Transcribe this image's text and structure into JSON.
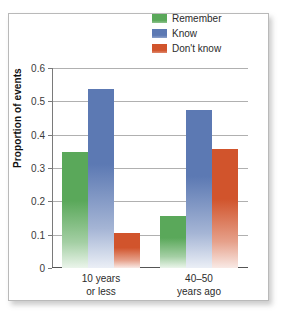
{
  "chart_data": {
    "type": "bar",
    "title": "",
    "xlabel": "",
    "ylabel": "Proportion of events",
    "ylim": [
      0,
      0.6
    ],
    "yticks": [
      "0",
      "0.1",
      "0.2",
      "0.3",
      "0.4",
      "0.5",
      "0.6"
    ],
    "ytick_values": [
      0,
      0.1,
      0.2,
      0.3,
      0.4,
      0.5,
      0.6
    ],
    "grid": true,
    "legend_position": "top-right",
    "categories": [
      "10 years\nor less",
      "40–50\nyears ago"
    ],
    "category_lines": [
      [
        "10 years",
        "or less"
      ],
      [
        "40–50",
        "years ago"
      ]
    ],
    "series": [
      {
        "name": "Remember",
        "color": "#5aa85a",
        "values": [
          0.347,
          0.156
        ]
      },
      {
        "name": "Know",
        "color": "#5c79b3",
        "values": [
          0.536,
          0.474
        ]
      },
      {
        "name": "Don't know",
        "color": "#d1542c",
        "values": [
          0.106,
          0.357
        ]
      }
    ]
  },
  "legend": {
    "items": [
      {
        "label": "Remember",
        "color": "#5aa85a"
      },
      {
        "label": "Know",
        "color": "#5c79b3"
      },
      {
        "label": "Don't know",
        "color": "#d1542c"
      }
    ]
  },
  "axis": {
    "y_title": "Proportion of events",
    "y_ticks": [
      "0.6",
      "0.5",
      "0.4",
      "0.3",
      "0.2",
      "0.1",
      "0"
    ],
    "x_groups": [
      {
        "line1": "10 years",
        "line2": "or less"
      },
      {
        "line1": "40–50",
        "line2": "years ago"
      }
    ]
  }
}
